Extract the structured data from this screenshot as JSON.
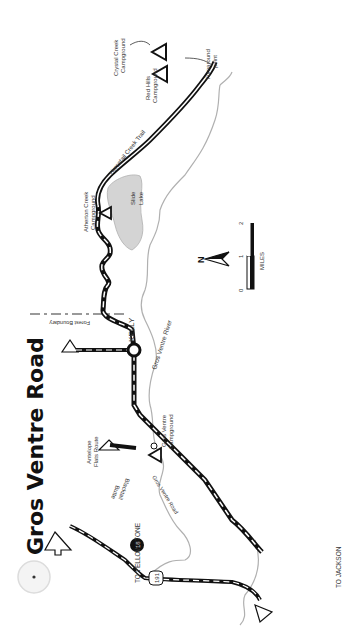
{
  "title": "Gros Ventre Road",
  "colors": {
    "road": "#111111",
    "road_dash": "#ffffff",
    "river": "#aaaaaa",
    "lake": "#d4d4d4",
    "text": "#333333",
    "title": "#111111",
    "boundary": "#888888"
  },
  "labels": {
    "crystal_creek": [
      "Crystal Creek",
      "Campground"
    ],
    "turnaround": [
      "Turnaround",
      "point"
    ],
    "red_hills": [
      "Red Hills",
      "Campground"
    ],
    "horsetail_trail": "Horsetail Creek Trail",
    "atherton_creek": [
      "Atherton Creek",
      "Campground"
    ],
    "slide_lake": [
      "Slide",
      "Lake"
    ],
    "forest_boundary": "Forest Boundary",
    "kelly": "KELLY",
    "river": "Gros Ventre River",
    "antelope_flats": [
      "Antelope",
      "Flats Route"
    ],
    "gros_ventre_campground": [
      "Gros Ventre",
      "Campground"
    ],
    "blacktail_butte": [
      "Blacktail",
      "Butte"
    ],
    "gros_ventre_road": "Gros Ventre Road",
    "to_yellowstone": "TO YELLOWSTONE",
    "to_jackson": "TO JACKSON",
    "route_191": "191",
    "route_18": "18"
  },
  "scale": {
    "label": "MILES",
    "ticks": [
      "0",
      "1",
      "2"
    ]
  },
  "compass": {
    "label": "N"
  }
}
